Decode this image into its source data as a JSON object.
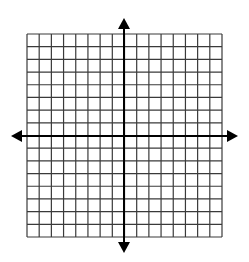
{
  "diagram": {
    "type": "coordinate-plane",
    "grid": {
      "columns": 16,
      "rows": 16,
      "line_color": "#3a3a3a",
      "background": "#ffffff"
    },
    "axes": {
      "x_axis": {
        "arrows": [
          "left",
          "right"
        ],
        "color": "#000000"
      },
      "y_axis": {
        "arrows": [
          "up",
          "down"
        ],
        "color": "#000000"
      }
    },
    "labels": []
  }
}
